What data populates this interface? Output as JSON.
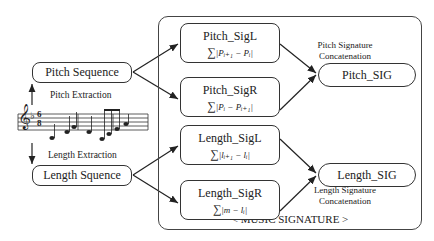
{
  "diagram": {
    "inputs": {
      "pitch_sequence": "Pitch Sequence",
      "length_sequence": "Length Squence"
    },
    "extraction_labels": {
      "pitch": "Pitch Extraction",
      "length": "Length Extraction"
    },
    "score": {
      "clef": "treble-clef",
      "key_signature": "♭",
      "time_signature_top": "6",
      "time_signature_bottom": "8"
    },
    "signatures": {
      "pitch_sigl": {
        "title": "Pitch_SigL",
        "sum": "∑",
        "formula": "|Pᵢ₊₁ − Pᵢ|"
      },
      "pitch_sigr": {
        "title": "Pitch_SigR",
        "sum": "∑",
        "formula": "|Pᵢ − Pᵢ₊₁|"
      },
      "length_sigl": {
        "title": "Length_SigL",
        "sum": "∑",
        "formula": "|lᵢ₊₁ − lᵢ|"
      },
      "length_sigr": {
        "title": "Length_SigR",
        "sum": "∑",
        "formula": "|m − lᵢ|"
      }
    },
    "outputs": {
      "pitch_sig": "Pitch_SIG",
      "length_sig": "Length_SIG"
    },
    "concatenation_labels": {
      "pitch_line1": "Pitch Signature",
      "pitch_line2": "Concatenation",
      "length_line1": "Length Signature",
      "length_line2": "Concatenation"
    },
    "container_label": "< MUSIC   SIGNATURE >"
  }
}
